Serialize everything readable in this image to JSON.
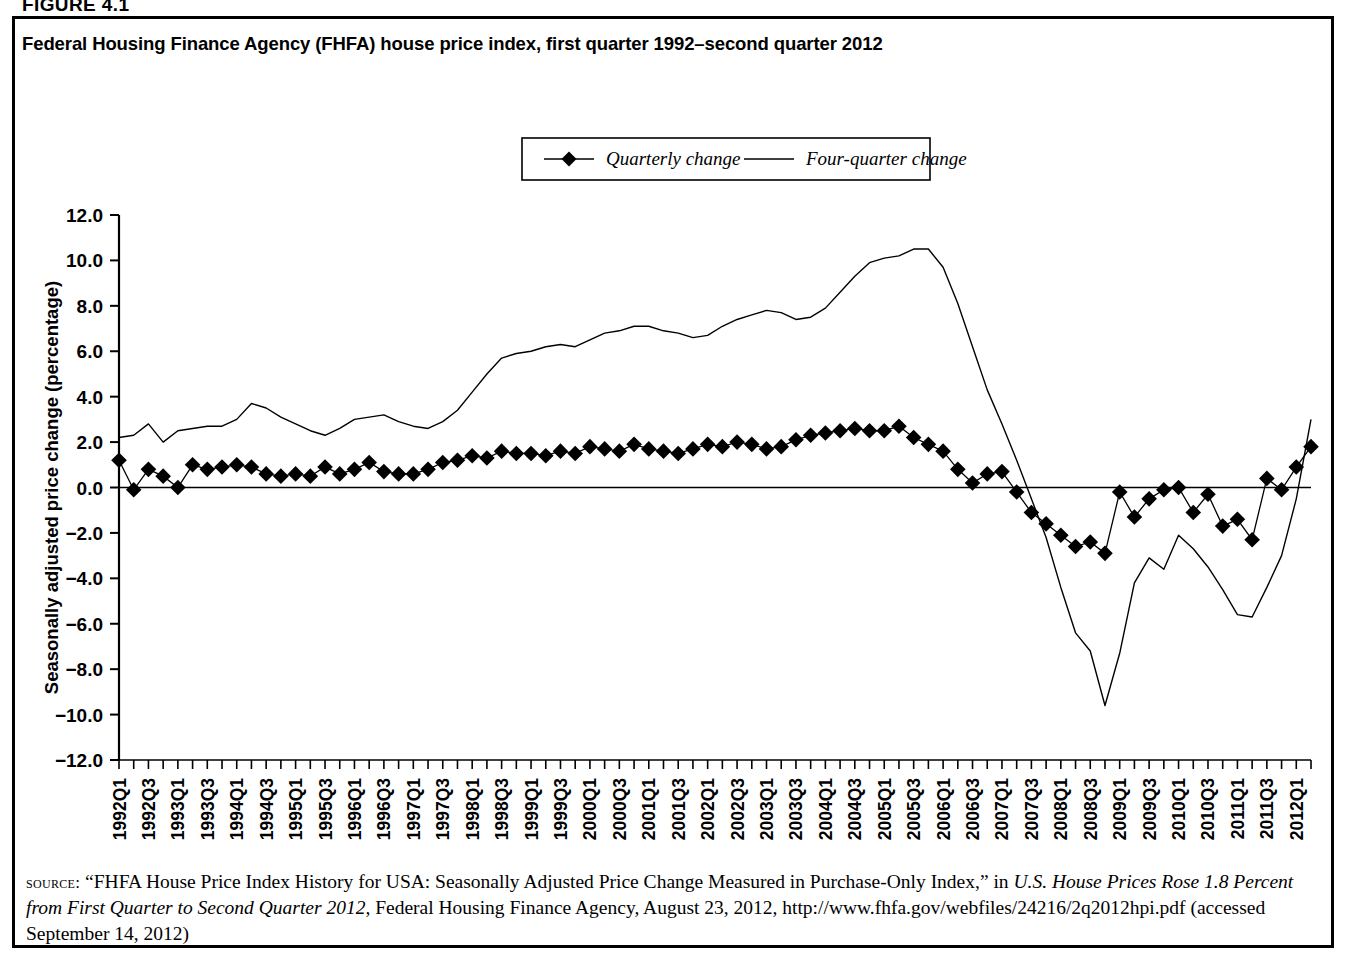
{
  "figure": {
    "label": "FIGURE 4.1",
    "title": "Federal Housing Finance Agency (FHFA) house price index, first quarter 1992–second quarter 2012"
  },
  "legend": {
    "items": [
      {
        "label": "Quarterly change",
        "marker": "diamond-marker-icon",
        "color": "#000000"
      },
      {
        "label": "Four-quarter change",
        "marker": "line-marker-icon",
        "color": "#000000"
      }
    ]
  },
  "axes": {
    "y_title": "Seasonally adjusted price change (percentage)",
    "x_title": "Year-quarter",
    "y_ticks": [
      "12.0",
      "10.0",
      "8.0",
      "6.0",
      "4.0",
      "2.0",
      "0.0",
      "−2.0",
      "−4.0",
      "−6.0",
      "−8.0",
      "−10.0",
      "−12.0"
    ]
  },
  "source": {
    "prefix": "source:",
    "line1_a": "“FHFA House Price Index History for USA: Seasonally Adjusted Price Change Measured in Purchase-Only Index,” in ",
    "line1_italic": "U.S. House Prices Rose 1.8 Percent from First Quarter to Second Quarter 2012",
    "line2": ", Federal Housing Finance Agency, August 23, 2012, http://www.fhfa.gov/webfiles/24216/2q2012hpi.pdf (accessed September 14, 2012)"
  },
  "chart_data": {
    "type": "line",
    "title": "Federal Housing Finance Agency (FHFA) house price index, first quarter 1992–second quarter 2012",
    "xlabel": "Year-quarter",
    "ylabel": "Seasonally adjusted price change (percentage)",
    "ylim": [
      -12.0,
      12.0
    ],
    "ytick_step": 2.0,
    "grid": false,
    "legend_position": "top-center",
    "categories": [
      "1992Q1",
      "1992Q2",
      "1992Q3",
      "1992Q4",
      "1993Q1",
      "1993Q2",
      "1993Q3",
      "1993Q4",
      "1994Q1",
      "1994Q2",
      "1994Q3",
      "1994Q4",
      "1995Q1",
      "1995Q2",
      "1995Q3",
      "1995Q4",
      "1996Q1",
      "1996Q2",
      "1996Q3",
      "1996Q4",
      "1997Q1",
      "1997Q2",
      "1997Q3",
      "1997Q4",
      "1998Q1",
      "1998Q2",
      "1998Q3",
      "1998Q4",
      "1999Q1",
      "1999Q2",
      "1999Q3",
      "1999Q4",
      "2000Q1",
      "2000Q2",
      "2000Q3",
      "2000Q4",
      "2001Q1",
      "2001Q2",
      "2001Q3",
      "2001Q4",
      "2002Q1",
      "2002Q2",
      "2002Q3",
      "2002Q4",
      "2003Q1",
      "2003Q2",
      "2003Q3",
      "2003Q4",
      "2004Q1",
      "2004Q2",
      "2004Q3",
      "2004Q4",
      "2005Q1",
      "2005Q2",
      "2005Q3",
      "2005Q4",
      "2006Q1",
      "2006Q2",
      "2006Q3",
      "2006Q4",
      "2007Q1",
      "2007Q2",
      "2007Q3",
      "2007Q4",
      "2008Q1",
      "2008Q2",
      "2008Q3",
      "2008Q4",
      "2009Q1",
      "2009Q2",
      "2009Q3",
      "2009Q4",
      "2010Q1",
      "2010Q2",
      "2010Q3",
      "2010Q4",
      "2011Q1",
      "2011Q2",
      "2011Q3",
      "2011Q4",
      "2012Q1",
      "2012Q2"
    ],
    "x_tick_labels": [
      "1992Q1",
      "1992Q3",
      "1993Q1",
      "1993Q3",
      "1994Q1",
      "1994Q3",
      "1995Q1",
      "1995Q3",
      "1996Q1",
      "1996Q3",
      "1997Q1",
      "1997Q3",
      "1998Q1",
      "1998Q3",
      "1999Q1",
      "1999Q3",
      "2000Q1",
      "2000Q3",
      "2001Q1",
      "2001Q3",
      "2002Q1",
      "2002Q3",
      "2003Q1",
      "2003Q3",
      "2004Q1",
      "2004Q3",
      "2005Q1",
      "2005Q3",
      "2006Q1",
      "2006Q3",
      "2007Q1",
      "2007Q3",
      "2008Q1",
      "2008Q3",
      "2009Q1",
      "2009Q3",
      "2010Q1",
      "2010Q3",
      "2011Q1",
      "2011Q3",
      "2012Q1"
    ],
    "series": [
      {
        "name": "Quarterly change",
        "marker": "diamond",
        "values": [
          1.2,
          -0.1,
          0.8,
          0.5,
          0.0,
          1.0,
          0.8,
          0.9,
          1.0,
          0.9,
          0.6,
          0.5,
          0.6,
          0.5,
          0.9,
          0.6,
          0.8,
          1.1,
          0.7,
          0.6,
          0.6,
          0.8,
          1.1,
          1.2,
          1.4,
          1.3,
          1.6,
          1.5,
          1.5,
          1.4,
          1.6,
          1.5,
          1.8,
          1.7,
          1.6,
          1.9,
          1.7,
          1.6,
          1.5,
          1.7,
          1.9,
          1.8,
          2.0,
          1.9,
          1.7,
          1.8,
          2.1,
          2.3,
          2.4,
          2.5,
          2.6,
          2.5,
          2.5,
          2.7,
          2.2,
          1.9,
          1.6,
          0.8,
          0.2,
          0.6,
          0.7,
          -0.2,
          -1.1,
          -1.6,
          -2.1,
          -2.6,
          -2.4,
          -2.9,
          -0.2,
          -1.3,
          -0.5,
          -0.1,
          0.0,
          -1.1,
          -0.3,
          -1.7,
          -1.4,
          -2.3,
          0.4,
          -0.1,
          0.9,
          1.8
        ]
      },
      {
        "name": "Four-quarter change",
        "marker": "none",
        "values": [
          2.2,
          2.3,
          2.8,
          2.0,
          2.5,
          2.6,
          2.7,
          2.7,
          3.0,
          3.7,
          3.5,
          3.1,
          2.8,
          2.5,
          2.3,
          2.6,
          3.0,
          3.1,
          3.2,
          2.9,
          2.7,
          2.6,
          2.9,
          3.4,
          4.2,
          5.0,
          5.7,
          5.9,
          6.0,
          6.2,
          6.3,
          6.2,
          6.5,
          6.8,
          6.9,
          7.1,
          7.1,
          6.9,
          6.8,
          6.6,
          6.7,
          7.1,
          7.4,
          7.6,
          7.8,
          7.7,
          7.4,
          7.5,
          7.9,
          8.6,
          9.3,
          9.9,
          10.1,
          10.2,
          10.5,
          10.5,
          9.7,
          8.1,
          6.2,
          4.3,
          2.8,
          1.2,
          -0.5,
          -2.2,
          -4.4,
          -6.4,
          -7.2,
          -9.6,
          -7.3,
          -4.2,
          -3.1,
          -3.6,
          -2.1,
          -2.7,
          -3.5,
          -4.5,
          -5.6,
          -5.7,
          -4.4,
          -3.0,
          -0.5,
          3.0
        ]
      }
    ]
  }
}
